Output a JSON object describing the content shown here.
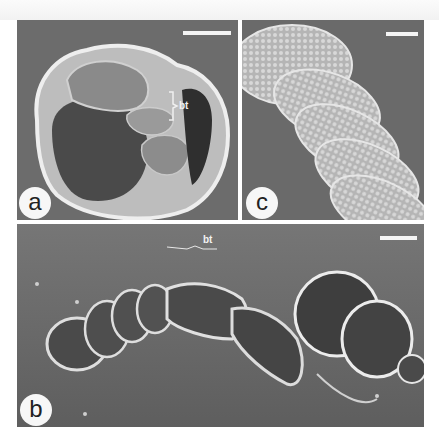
{
  "figure": {
    "panels": [
      {
        "id": "a",
        "label": "a",
        "annotation": "bt",
        "description": "SEM micrograph of coiled specimen with open sheath, bt bracket"
      },
      {
        "id": "c",
        "label": "c",
        "annotation": "",
        "description": "SEM micrograph close-up of segmented coiled surface with cellular texture"
      },
      {
        "id": "b",
        "label": "b",
        "annotation": "bt",
        "description": "SEM micrograph of elongated segmented specimen lying on substrate"
      }
    ],
    "colors": {
      "background": "#6e6e6e",
      "specimen_highlight": "#e8e8e8",
      "specimen_shadow": "#3a3a3a",
      "label_circle": "#f7f7f7"
    }
  }
}
